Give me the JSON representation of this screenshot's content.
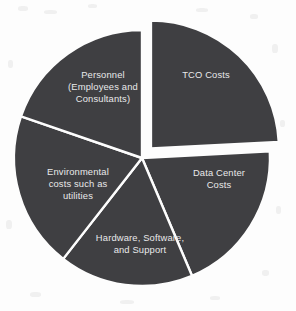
{
  "chart_data": {
    "type": "pie",
    "title": "",
    "subtitle": "",
    "xlabel": "",
    "ylabel": "",
    "legend_position": "none",
    "grid": false,
    "background_color": "#fdfdfd",
    "slice_fill_color": "#3f3f42",
    "slice_border_color": "#fdfdfd",
    "label_text_color": "#e9e9ea",
    "center": {
      "x": 142,
      "y": 158
    },
    "radius": 128,
    "categories": [
      "TCO Costs",
      "Data Center Costs",
      "Hardware, Software, and Support",
      "Environmental costs such as utilities",
      "Personnel (Employees and Consultants)"
    ],
    "values": [
      24,
      19.5,
      17,
      19.5,
      20
    ],
    "slices": [
      {
        "name": "TCO Costs",
        "label_lines": [
          "TCO Costs"
        ],
        "start_angle": 0,
        "end_angle": 87,
        "value": 24,
        "exploded": true,
        "explode_offset": 13,
        "label_x": 206,
        "label_y": 76
      },
      {
        "name": "Data Center Costs",
        "label_lines": [
          "Data Center",
          "Costs"
        ],
        "start_angle": 87,
        "end_angle": 157,
        "value": 19.5,
        "exploded": false,
        "explode_offset": 0,
        "label_x": 219,
        "label_y": 180
      },
      {
        "name": "Hardware, Software, and Support",
        "label_lines": [
          "Hardware, Software,",
          "and Support"
        ],
        "start_angle": 157,
        "end_angle": 218,
        "value": 17,
        "exploded": false,
        "explode_offset": 0,
        "label_x": 140,
        "label_y": 245
      },
      {
        "name": "Environmental costs such as utilities",
        "label_lines": [
          "Environmental",
          "costs such as",
          "utilities"
        ],
        "start_angle": 218,
        "end_angle": 289,
        "value": 19.5,
        "exploded": false,
        "explode_offset": 0,
        "label_x": 78,
        "label_y": 185
      },
      {
        "name": "Personnel (Employees and Consultants)",
        "label_lines": [
          "Personnel",
          "(Employees and",
          "Consultants)"
        ],
        "start_angle": 289,
        "end_angle": 360,
        "value": 20,
        "exploded": false,
        "explode_offset": 0,
        "label_x": 103,
        "label_y": 88
      }
    ]
  }
}
